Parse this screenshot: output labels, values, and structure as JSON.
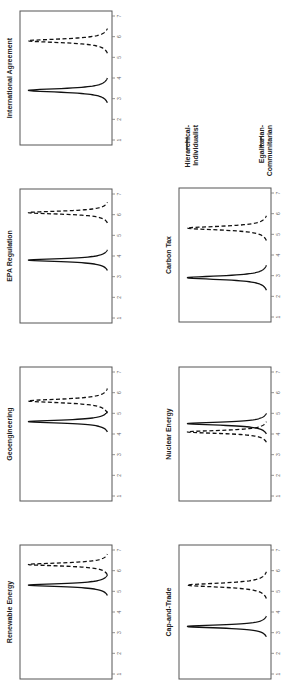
{
  "chart_data": {
    "type": "line",
    "orientation": "rotated-90-ccw",
    "title": "",
    "xlabel": "",
    "ylabel": "",
    "xlim": [
      1,
      7
    ],
    "xticks": [
      "1",
      "2",
      "3",
      "4",
      "5",
      "6",
      "7"
    ],
    "legend": {
      "placement": "top-right",
      "entries": [
        {
          "name": "Hierarchical-\nIndividualist",
          "line1": "Hierarchical-",
          "line2": "Individualist",
          "style": "solid"
        },
        {
          "name": "Egalitarian-\nCommunitarian",
          "line1": "Egalitarian-",
          "line2": "Communitarian",
          "style": "dashed"
        }
      ]
    },
    "panels": [
      {
        "title": "International Agreement",
        "series": [
          {
            "name": "Hierarchical-Individualist",
            "style": "solid",
            "peak": 3.4,
            "spread": 0.12
          },
          {
            "name": "Egalitarian-Communitarian",
            "style": "dashed",
            "peak": 5.8,
            "spread": 0.12
          }
        ]
      },
      {
        "title": "EPA Regulation",
        "series": [
          {
            "name": "Hierarchical-Individualist",
            "style": "solid",
            "peak": 3.8,
            "spread": 0.1
          },
          {
            "name": "Egalitarian-Communitarian",
            "style": "dashed",
            "peak": 6.1,
            "spread": 0.1
          }
        ]
      },
      {
        "title": "Geoengineering",
        "series": [
          {
            "name": "Hierarchical-Individualist",
            "style": "solid",
            "peak": 4.6,
            "spread": 0.1
          },
          {
            "name": "Egalitarian-Communitarian",
            "style": "dashed",
            "peak": 5.6,
            "spread": 0.12
          }
        ]
      },
      {
        "title": "Carbon Tax",
        "series": [
          {
            "name": "Hierarchical-Individualist",
            "style": "solid",
            "peak": 2.9,
            "spread": 0.12
          },
          {
            "name": "Egalitarian-Communitarian",
            "style": "dashed",
            "peak": 5.3,
            "spread": 0.12
          }
        ]
      },
      {
        "title": "Renewable Energy",
        "series": [
          {
            "name": "Hierarchical-Individualist",
            "style": "solid",
            "peak": 5.3,
            "spread": 0.1
          },
          {
            "name": "Egalitarian-Communitarian",
            "style": "dashed",
            "peak": 6.3,
            "spread": 0.1
          }
        ]
      },
      {
        "title": "Nuclear Energy",
        "series": [
          {
            "name": "Hierarchical-Individualist",
            "style": "solid",
            "peak": 4.5,
            "spread": 0.1
          },
          {
            "name": "Egalitarian-Communitarian",
            "style": "dashed",
            "peak": 4.1,
            "spread": 0.1
          }
        ]
      },
      {
        "title": "Cap-and-Trade",
        "series": [
          {
            "name": "Hierarchical-Individualist",
            "style": "solid",
            "peak": 3.3,
            "spread": 0.1
          },
          {
            "name": "Egalitarian-Communitarian",
            "style": "dashed",
            "peak": 5.3,
            "spread": 0.13
          }
        ]
      }
    ]
  }
}
